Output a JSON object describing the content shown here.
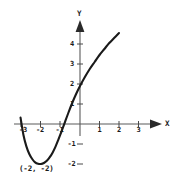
{
  "chart_data": {
    "type": "line",
    "title": "",
    "xlabel": "X",
    "ylabel": "Y",
    "xlim": [
      -3.6,
      3.6
    ],
    "ylim": [
      -2.6,
      4.9
    ],
    "grid": false,
    "legend": null,
    "x_ticks": [
      {
        "value": -3,
        "label": "-3"
      },
      {
        "value": -2,
        "label": "-2"
      },
      {
        "value": -1,
        "label": "-1"
      },
      {
        "value": 1,
        "label": "1"
      },
      {
        "value": 2,
        "label": "2"
      },
      {
        "value": 3,
        "label": "3"
      }
    ],
    "y_ticks": [
      {
        "value": 4,
        "label": "4"
      },
      {
        "value": 3,
        "label": "3"
      },
      {
        "value": 2,
        "label": "2"
      },
      {
        "value": 1,
        "label": "1"
      },
      {
        "value": -1,
        "label": "-1"
      },
      {
        "value": -2,
        "label": "-2"
      }
    ],
    "series": [
      {
        "name": "curve",
        "color": "#1a1a1a",
        "x": [
          -3.05,
          -2.9,
          -2.75,
          -2.6,
          -2.45,
          -2.3,
          -2.15,
          -2.0,
          -1.85,
          -1.7,
          -1.55,
          -1.4,
          -1.25,
          -1.1,
          -0.95,
          -0.8,
          -0.6,
          -0.4,
          -0.2,
          0.0,
          0.25,
          0.5,
          0.75,
          1.0,
          1.25,
          1.5,
          1.75,
          2.0
        ],
        "values": [
          0.32,
          -0.55,
          -1.12,
          -1.5,
          -1.75,
          -1.92,
          -1.99,
          -2.0,
          -1.95,
          -1.84,
          -1.66,
          -1.42,
          -1.12,
          -0.76,
          -0.38,
          0.02,
          0.55,
          1.05,
          1.5,
          1.9,
          2.35,
          2.75,
          3.1,
          3.45,
          3.75,
          4.05,
          4.3,
          4.55
        ]
      }
    ],
    "annotations": [
      {
        "label": "(-2, -2)",
        "x": -2.0,
        "y": -2.0
      }
    ],
    "vertex": {
      "x": -2,
      "y": -2
    },
    "axis_color": "#555555",
    "curve_color": "#1a1a1a"
  }
}
